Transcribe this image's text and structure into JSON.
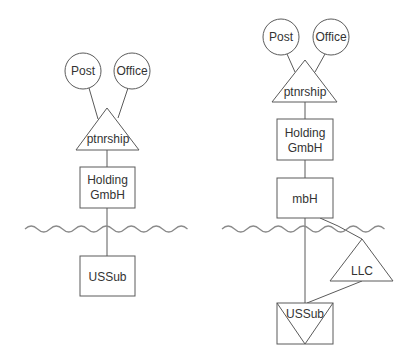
{
  "left_diagram": {
    "owners": [
      {
        "label": "Post"
      },
      {
        "label": "Office"
      }
    ],
    "partnership": {
      "label": "ptnrship"
    },
    "holding": {
      "line1": "Holding",
      "line2": "GmbH"
    },
    "subsidiary": {
      "label": "USSub"
    }
  },
  "right_diagram": {
    "owners": [
      {
        "label": "Post"
      },
      {
        "label": "Office"
      }
    ],
    "partnership": {
      "label": "ptnrship"
    },
    "holding": {
      "line1": "Holding",
      "line2": "GmbH"
    },
    "intermediate": {
      "label": "mbH"
    },
    "llc": {
      "label": "LLC"
    },
    "subsidiary": {
      "label": "USSub"
    }
  },
  "colors": {
    "stroke": "#5a5a5a",
    "wave": "#8a8a8a",
    "text": "#333333",
    "background": "#ffffff"
  }
}
